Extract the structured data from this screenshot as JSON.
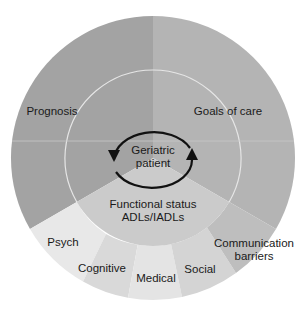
{
  "diagram": {
    "center": {
      "label_line1": "Geriatric",
      "label_line2": "patient"
    },
    "inner_segments": [
      {
        "id": "prognosis",
        "label": "Prognosis",
        "color": "#a3a3a3"
      },
      {
        "id": "goals-of-care",
        "label": "Goals of care",
        "color": "#b4b4b4"
      },
      {
        "id": "functional-status",
        "label_line1": "Functional status",
        "label_line2": "ADLs/IADLs",
        "color": "#cbcbcb"
      }
    ],
    "outer_segments": [
      {
        "id": "psych",
        "label": "Psych",
        "color": "#e8e8e8"
      },
      {
        "id": "cognitive",
        "label": "Cognitive",
        "color": "#d9d9d9"
      },
      {
        "id": "medical",
        "label": "Medical",
        "color": "#e4e4e4"
      },
      {
        "id": "social",
        "label": "Social",
        "color": "#d4d4d4"
      },
      {
        "id": "communication-barriers",
        "label_line1": "Communication",
        "label_line2": "barriers",
        "color": "#bebebe"
      }
    ],
    "cycle_arrows": "bidirectional circular arrows around center"
  }
}
